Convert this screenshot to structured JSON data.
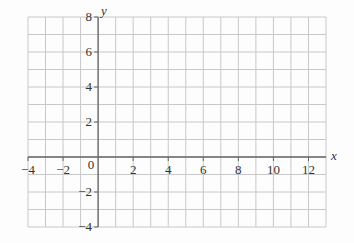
{
  "chart_data": {
    "type": "scatter",
    "title": "",
    "xlabel": "x",
    "ylabel": "y",
    "xlim": [
      -4,
      13
    ],
    "ylim": [
      -4,
      8
    ],
    "grid": true,
    "grid_step": 1,
    "x_ticks": [
      -4,
      -2,
      0,
      2,
      4,
      6,
      8,
      10,
      12
    ],
    "x_tick_labels": [
      "−4",
      "−2",
      "0",
      "2",
      "4",
      "6",
      "8",
      "10",
      "12"
    ],
    "y_ticks": [
      -4,
      -2,
      2,
      4,
      6,
      8
    ],
    "y_tick_labels": [
      "−4",
      "−2",
      "2",
      "4",
      "6",
      "8"
    ],
    "series": [],
    "colors": {
      "grid": "#c8c8c8",
      "axis": "#666666",
      "text": "#333333"
    }
  }
}
